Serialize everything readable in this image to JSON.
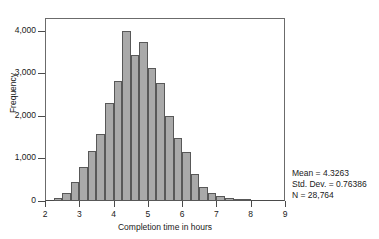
{
  "chart_data": {
    "type": "bar",
    "title": "",
    "subtitle": "",
    "xlabel": "Completion time in hours",
    "ylabel": "Frequency",
    "xlim": [
      2,
      9
    ],
    "ylim": [
      0,
      4300
    ],
    "grid": false,
    "legend": null,
    "bin_width": 0.25,
    "bar_fill_color": "#a9a9a9",
    "bar_border_color": "#585858",
    "xticks": [
      "2",
      "3",
      "4",
      "5",
      "6",
      "7",
      "8",
      "9"
    ],
    "xtick_values": [
      2,
      3,
      4,
      5,
      6,
      7,
      8,
      9
    ],
    "yticks": [
      "0",
      "1,000",
      "2,000",
      "3,000",
      "4,000"
    ],
    "ytick_values": [
      0,
      1000,
      2000,
      3000,
      4000
    ],
    "bin_starts": [
      2.25,
      2.5,
      2.75,
      3.0,
      3.25,
      3.5,
      3.75,
      4.0,
      4.25,
      4.5,
      4.75,
      5.0,
      5.25,
      5.5,
      5.75,
      6.0,
      6.25,
      6.5,
      6.75,
      7.0,
      7.25,
      7.5,
      7.75
    ],
    "values": [
      60,
      190,
      440,
      800,
      1180,
      1570,
      2300,
      2820,
      4000,
      3440,
      3740,
      3130,
      2770,
      2000,
      1480,
      1150,
      640,
      330,
      180,
      110,
      70,
      40,
      25
    ],
    "annotations": [
      "Mean = 4.3263",
      "Std. Dev. = 0.76386",
      "N = 28,764"
    ]
  },
  "stats": {
    "mean_label": "Mean = 4.3263",
    "sd_label": "Std. Dev. = 0.76386",
    "n_label": "N = 28,764"
  }
}
